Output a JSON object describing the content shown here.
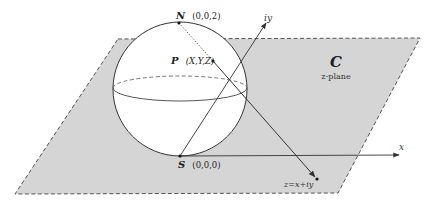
{
  "diagram": {
    "colors": {
      "plane_fill": "#d5d5d5",
      "plane_edge": "#555555",
      "sphere_fill": "#ffffff",
      "line": "#333333"
    },
    "plane": {
      "symbol": "C",
      "name": "z-plane"
    },
    "axes": {
      "real": "x",
      "imaginary": "iy"
    },
    "points": {
      "north": {
        "name": "N",
        "coords": "(0,0,2)"
      },
      "point": {
        "name": "P",
        "coords": "(X,Y,Z)"
      },
      "south": {
        "name": "S",
        "coords": "(0,0,0)"
      },
      "projection": {
        "label": "z=x+iy"
      }
    }
  }
}
